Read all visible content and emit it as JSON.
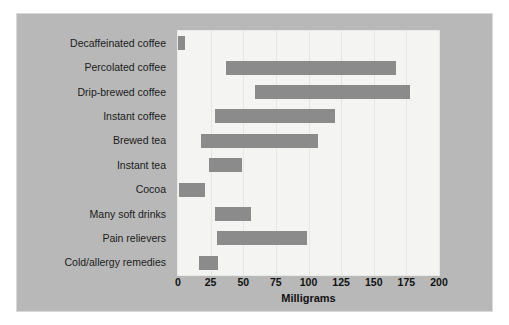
{
  "chart_data": {
    "type": "bar",
    "orientation": "horizontal",
    "bar_style": "range",
    "title": "",
    "xlabel": "Milligrams",
    "ylabel": "",
    "xlim": [
      0,
      200
    ],
    "xticks": [
      0,
      25,
      50,
      75,
      100,
      125,
      150,
      175,
      200
    ],
    "xtick_labels": [
      "0",
      "25",
      "50",
      "75",
      "100",
      "125",
      "150",
      "175",
      "200"
    ],
    "grid": true,
    "legend": false,
    "categories": [
      "Decaffeinated coffee",
      "Percolated coffee",
      "Drip-brewed coffee",
      "Instant coffee",
      "Brewed tea",
      "Instant tea",
      "Cocoa",
      "Many soft drinks",
      "Pain relievers",
      "Cold/allergy remedies"
    ],
    "ranges": [
      [
        0,
        5
      ],
      [
        37,
        167
      ],
      [
        59,
        178
      ],
      [
        28,
        120
      ],
      [
        18,
        107
      ],
      [
        24,
        49
      ],
      [
        1,
        21
      ],
      [
        28,
        56
      ],
      [
        30,
        99
      ],
      [
        16,
        31
      ]
    ],
    "series": [
      {
        "name": "low",
        "values": [
          0,
          37,
          59,
          28,
          18,
          24,
          1,
          28,
          30,
          16
        ]
      },
      {
        "name": "high",
        "values": [
          5,
          167,
          178,
          120,
          107,
          49,
          21,
          56,
          99,
          31
        ]
      }
    ],
    "colors": {
      "bar": "#8b8b8b",
      "plot_background": "#f4f4f2",
      "figure_background": "#b8b8b8",
      "gridline": "#e6e6e3",
      "text": "#1b1b1b"
    }
  }
}
